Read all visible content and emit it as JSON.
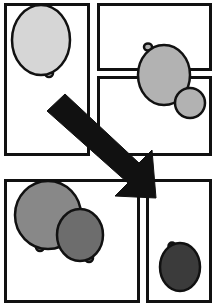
{
  "figure": {
    "width": 218,
    "height": 306,
    "background_color": "#ffffff",
    "border_color": "#111111",
    "panel_fill": "#ffffff"
  },
  "arrow": {
    "name": "transition-arrow",
    "color": "#111111",
    "direction": "down-right",
    "start_x": 56,
    "start_y": 102,
    "tip_x": 156,
    "tip_y": 198,
    "shaft_width": 16,
    "head_width": 40,
    "points": "47,111 65,94 139,163 152,150 156,198 115,196 128,183"
  },
  "panels": [
    {
      "id": "panel-top-left",
      "label": "Top left panel",
      "x": 4,
      "y": 3,
      "width": 86,
      "height": 153,
      "border_width": 3,
      "cells": [
        {
          "name": "cell-light-ellipse",
          "shape": "ellipse",
          "cx": 41,
          "cy": 40,
          "rx": 29,
          "ry": 35,
          "fill": "#d6d6d6",
          "stroke_width": 2.5,
          "tail": {
            "cx": 49,
            "cy": 73,
            "rx": 4,
            "ry": 4
          }
        }
      ]
    },
    {
      "id": "panel-top-right",
      "label": "Top right panel",
      "x": 97,
      "y": 3,
      "width": 115,
      "height": 68,
      "border_width": 3,
      "cells": []
    },
    {
      "id": "panel-middle-right",
      "label": "Middle right panel",
      "x": 97,
      "y": 76,
      "width": 115,
      "height": 80,
      "border_width": 3,
      "cells": [
        {
          "name": "cell-budding-mother",
          "shape": "ellipse",
          "cx": 164,
          "cy": 75,
          "rx": 26,
          "ry": 30,
          "fill": "#b2b2b2",
          "stroke_width": 2.5,
          "tail": {
            "cx": 148,
            "cy": 47,
            "rx": 4,
            "ry": 3.5
          }
        },
        {
          "name": "cell-budding-daughter",
          "shape": "ellipse",
          "cx": 190,
          "cy": 103,
          "rx": 15,
          "ry": 15,
          "fill": "#b2b2b2",
          "stroke_width": 2.5,
          "tail": null
        }
      ]
    },
    {
      "id": "panel-bottom-left",
      "label": "Bottom left panel",
      "x": 4,
      "y": 179,
      "width": 136,
      "height": 124,
      "border_width": 3,
      "cells": [
        {
          "name": "cell-large-gray-ellipse",
          "shape": "ellipse",
          "cx": 48,
          "cy": 215,
          "rx": 33,
          "ry": 34,
          "fill": "#888888",
          "stroke_width": 2.5,
          "tail": {
            "cx": 40,
            "cy": 247,
            "rx": 4,
            "ry": 4
          }
        },
        {
          "name": "cell-small-dark-ellipse",
          "shape": "ellipse",
          "cx": 80,
          "cy": 235,
          "rx": 23,
          "ry": 26,
          "fill": "#6d6d6d",
          "stroke_width": 2.5,
          "tail": {
            "cx": 89,
            "cy": 258,
            "rx": 4,
            "ry": 4
          }
        }
      ]
    },
    {
      "id": "panel-bottom-right",
      "label": "Bottom right panel",
      "x": 146,
      "y": 179,
      "width": 66,
      "height": 124,
      "border_width": 3,
      "cells": [
        {
          "name": "cell-very-dark-ellipse",
          "shape": "ellipse",
          "cx": 180,
          "cy": 267,
          "rx": 20,
          "ry": 24,
          "fill": "#3b3b3b",
          "stroke_width": 2.5,
          "tail": {
            "cx": 172,
            "cy": 246,
            "rx": 3.5,
            "ry": 3.5
          }
        }
      ]
    }
  ]
}
